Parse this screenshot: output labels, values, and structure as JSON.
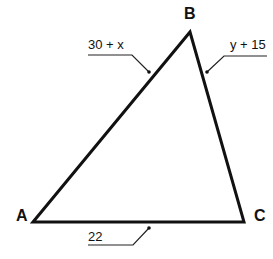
{
  "diagram": {
    "type": "triangle",
    "vertices": [
      {
        "label": "A",
        "x": 33,
        "y": 222
      },
      {
        "label": "B",
        "x": 190,
        "y": 32
      },
      {
        "label": "C",
        "x": 244,
        "y": 222
      }
    ],
    "sides": [
      {
        "between": "AB",
        "label": "30 + x"
      },
      {
        "between": "BC",
        "label": "y + 15"
      },
      {
        "between": "AC",
        "label": "22"
      }
    ],
    "colors": {
      "stroke": "#111111",
      "background": "#ffffff"
    }
  }
}
